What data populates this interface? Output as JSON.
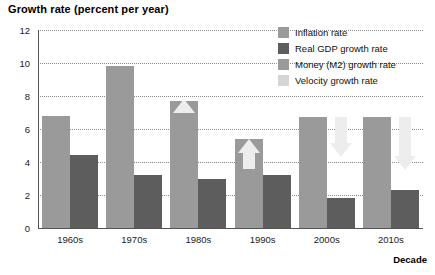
{
  "chart_data": {
    "type": "bar",
    "title": "Growth rate (percent per year)",
    "xlabel": "Decade",
    "ylabel": "",
    "ylim": [
      0,
      12
    ],
    "yticks": [
      0,
      2,
      4,
      6,
      8,
      10,
      12
    ],
    "grid": true,
    "legend_position": "top-right",
    "categories": [
      "1960s",
      "1970s",
      "1980s",
      "1990s",
      "2000s",
      "2010s"
    ],
    "series": [
      {
        "name": "Money (M2) growth rate",
        "color": "#9a9a9a",
        "values": [
          6.8,
          9.8,
          7.7,
          5.4,
          6.7,
          6.7
        ]
      },
      {
        "name": "Real GDP growth rate",
        "color": "#5d5d5d",
        "values": [
          4.4,
          3.2,
          3.0,
          3.2,
          1.8,
          2.3
        ]
      }
    ],
    "legend": [
      {
        "label": "Inflation rate",
        "color": "#9a9a9a"
      },
      {
        "label": "Real GDP growth rate",
        "color": "#5d5d5d"
      },
      {
        "label": "Money (M2) growth rate",
        "color": "#9a9a9a"
      },
      {
        "label": "Velocity growth rate",
        "color": "#d5d5d5"
      }
    ],
    "annotations": [
      {
        "category": "1980s",
        "kind": "velocity-arrow",
        "direction": "up",
        "from": 7.0,
        "to": 7.8
      },
      {
        "category": "1990s",
        "kind": "velocity-arrow",
        "direction": "up",
        "from": 3.6,
        "to": 5.4
      },
      {
        "category": "2000s",
        "kind": "velocity-arrow",
        "direction": "down",
        "from": 6.7,
        "to": 4.3
      },
      {
        "category": "2010s",
        "kind": "velocity-arrow",
        "direction": "down",
        "from": 6.7,
        "to": 3.5
      }
    ]
  }
}
